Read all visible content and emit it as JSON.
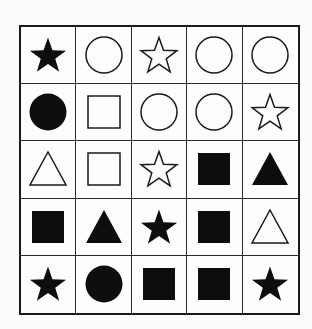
{
  "puzzle": {
    "rows": 5,
    "cols": 5,
    "colors": {
      "fill": "#0d0d0d",
      "stroke": "#1a1a1a",
      "background": "#fdfdfc",
      "grid_line": "#2a2a2a"
    },
    "cells": [
      [
        {
          "shape": "star",
          "style": "filled"
        },
        {
          "shape": "circle",
          "style": "outline"
        },
        {
          "shape": "star",
          "style": "outline"
        },
        {
          "shape": "circle",
          "style": "outline"
        },
        {
          "shape": "circle",
          "style": "outline"
        }
      ],
      [
        {
          "shape": "circle",
          "style": "filled"
        },
        {
          "shape": "square",
          "style": "outline"
        },
        {
          "shape": "circle",
          "style": "outline"
        },
        {
          "shape": "circle",
          "style": "outline"
        },
        {
          "shape": "star",
          "style": "outline"
        }
      ],
      [
        {
          "shape": "triangle",
          "style": "outline"
        },
        {
          "shape": "square",
          "style": "outline"
        },
        {
          "shape": "star",
          "style": "outline"
        },
        {
          "shape": "square",
          "style": "filled"
        },
        {
          "shape": "triangle",
          "style": "filled"
        }
      ],
      [
        {
          "shape": "square",
          "style": "filled"
        },
        {
          "shape": "triangle",
          "style": "filled"
        },
        {
          "shape": "star",
          "style": "filled"
        },
        {
          "shape": "square",
          "style": "filled"
        },
        {
          "shape": "triangle",
          "style": "outline"
        }
      ],
      [
        {
          "shape": "star",
          "style": "filled"
        },
        {
          "shape": "circle",
          "style": "filled"
        },
        {
          "shape": "square",
          "style": "filled"
        },
        {
          "shape": "square",
          "style": "filled"
        },
        {
          "shape": "star",
          "style": "filled"
        }
      ]
    ]
  }
}
